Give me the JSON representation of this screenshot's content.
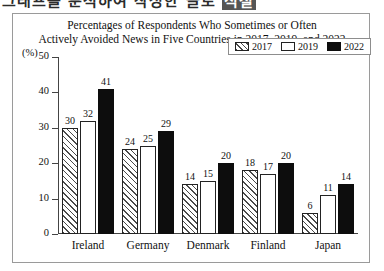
{
  "top_sliver": {
    "text_left": "그래프를 분석하여 작성한 글로",
    "text_badge": "적절"
  },
  "chart_frame": {
    "unit_label": "(%)"
  },
  "legend": {
    "position": "top-right",
    "items": [
      {
        "label": "2017",
        "pattern": "diagonal-hatch",
        "color": "#ffffff"
      },
      {
        "label": "2019",
        "pattern": "empty",
        "color": "#ffffff"
      },
      {
        "label": "2022",
        "pattern": "solid",
        "color": "#0d0d0d"
      }
    ]
  },
  "chart_data": {
    "type": "bar",
    "title": "Percentages of Respondents Who Sometimes or Often Actively Avoided News in Five Countries in 2017, 2019, and 2022",
    "title_lines": [
      "Percentages of Respondents Who Sometimes or Often",
      "Actively Avoided News in Five Countries in 2017, 2019, and 2022"
    ],
    "xlabel": "",
    "ylabel": "(%)",
    "ylim": [
      0,
      50
    ],
    "yticks": [
      0,
      10,
      20,
      30,
      40,
      50
    ],
    "ytick_labels": [
      "0",
      "10",
      "20",
      "30",
      "40",
      "50"
    ],
    "grid": false,
    "legend_position": "upper right",
    "categories": [
      "Ireland",
      "Germany",
      "Denmark",
      "Finland",
      "Japan"
    ],
    "series": [
      {
        "name": "2017",
        "values": [
          30,
          24,
          14,
          18,
          6
        ]
      },
      {
        "name": "2019",
        "values": [
          32,
          25,
          15,
          17,
          11
        ]
      },
      {
        "name": "2022",
        "values": [
          41,
          29,
          20,
          20,
          14
        ]
      }
    ]
  }
}
